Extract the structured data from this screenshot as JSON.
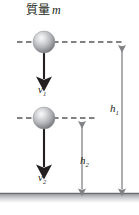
{
  "figure": {
    "background_color": "#ffffff",
    "width": 139,
    "height": 215
  },
  "labels": {
    "mass_text": "質量",
    "mass_symbol": "m",
    "velocity_1": "v",
    "velocity_1_sub": "1",
    "velocity_2": "v",
    "velocity_2_sub": "2",
    "height_1": "h",
    "height_1_sub": "1",
    "height_2": "h",
    "height_2_sub": "2"
  },
  "colors": {
    "stroke": "#231f20",
    "dash": "#58595b",
    "measure": "#808285",
    "ground_top": "#6d6e71",
    "ground_bottom": "#ffffff",
    "sphere_light": "#f2f2f2",
    "sphere_mid": "#b5b7b9",
    "sphere_dark": "#6d6e71"
  },
  "geometry": {
    "sphere_1": {
      "cx": 44,
      "cy": 42,
      "r": 11
    },
    "sphere_2": {
      "cx": 44,
      "cy": 118,
      "r": 11
    },
    "dashed_line_1": {
      "x1": 17,
      "x2": 124,
      "y": 42
    },
    "dashed_line_2": {
      "x1": 17,
      "x2": 98,
      "y": 118
    },
    "velocity_arrow_1": {
      "x": 44,
      "y1": 53,
      "y2": 80
    },
    "velocity_arrow_2": {
      "x": 44,
      "y1": 129,
      "y2": 168
    },
    "height_arrow_1": {
      "x": 122,
      "y1": 42,
      "y2": 193
    },
    "height_arrow_2": {
      "x": 82,
      "y1": 118,
      "y2": 193
    },
    "ground": {
      "y": 193,
      "height": 10
    }
  }
}
